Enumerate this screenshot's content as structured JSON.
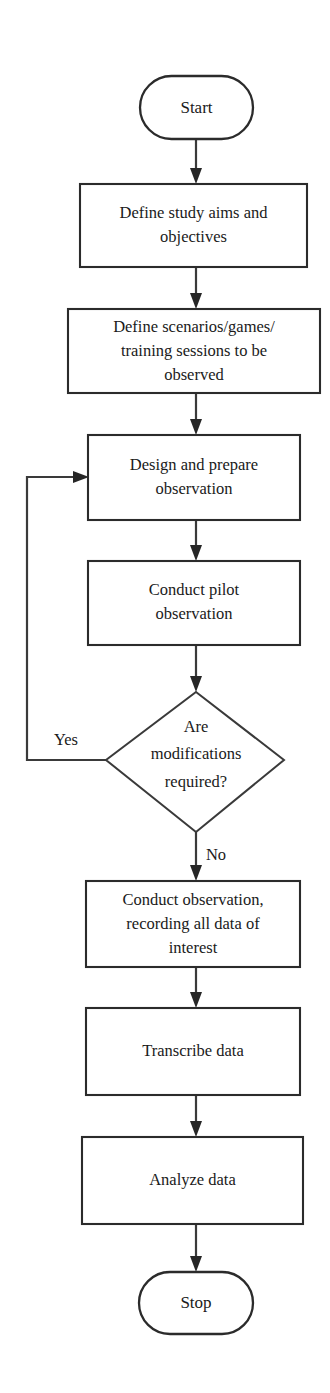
{
  "diagram": {
    "type": "flowchart",
    "orientation": "vertical",
    "colors": {
      "background": "#ffffff",
      "stroke": "#2b2b2b",
      "text": "#1a1a1a",
      "arrow_fill": "#262626"
    },
    "nodes": [
      {
        "id": "start",
        "shape": "terminator",
        "label": "Start",
        "lines": [
          "Start"
        ]
      },
      {
        "id": "define-aims",
        "shape": "process",
        "label": "Define study aims and objectives",
        "lines": [
          "Define study aims and",
          "objectives"
        ]
      },
      {
        "id": "define-scenarios",
        "shape": "process",
        "label": "Define scenarios/games/ training sessions to be observed",
        "lines": [
          "Define scenarios/games/",
          "training sessions to be",
          "observed"
        ]
      },
      {
        "id": "design-prepare",
        "shape": "process",
        "label": "Design and prepare observation",
        "lines": [
          "Design and prepare",
          "observation"
        ]
      },
      {
        "id": "conduct-pilot",
        "shape": "process",
        "label": "Conduct pilot observation",
        "lines": [
          "Conduct pilot",
          "observation"
        ]
      },
      {
        "id": "modifications-decision",
        "shape": "decision",
        "label": "Are modifications required?",
        "lines": [
          "Are",
          "modifications",
          "required?"
        ]
      },
      {
        "id": "conduct-observation",
        "shape": "process",
        "label": "Conduct observation, recording all data of interest",
        "lines": [
          "Conduct observation,",
          "recording all data of",
          "interest"
        ]
      },
      {
        "id": "transcribe",
        "shape": "process",
        "label": "Transcribe data",
        "lines": [
          "Transcribe data"
        ]
      },
      {
        "id": "analyze",
        "shape": "process",
        "label": "Analyze data",
        "lines": [
          "Analyze data"
        ]
      },
      {
        "id": "stop",
        "shape": "terminator",
        "label": "Stop",
        "lines": [
          "Stop"
        ]
      }
    ],
    "edge_labels": {
      "yes": "Yes",
      "no": "No"
    }
  }
}
